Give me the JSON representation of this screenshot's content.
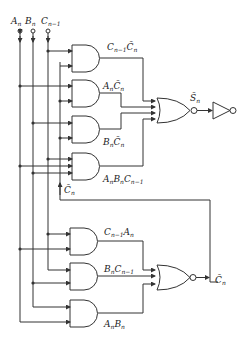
{
  "diagram": {
    "inputs": [
      {
        "id": "An",
        "label": "A",
        "sub": "n"
      },
      {
        "id": "Bn",
        "label": "B",
        "sub": "n"
      },
      {
        "id": "Cn1",
        "label": "C",
        "sub": "n−1"
      }
    ],
    "sum_section": {
      "and_gates": [
        {
          "id": "g1",
          "label": "C",
          "sub": "n−1",
          "label2": "C̄",
          "sub2": "n"
        },
        {
          "id": "g2",
          "label": "A",
          "sub": "n",
          "label2": "C̄",
          "sub2": "n"
        },
        {
          "id": "g3",
          "label": "B",
          "sub": "n",
          "label2": "C̄",
          "sub2": "n"
        },
        {
          "id": "g4",
          "label": "A",
          "sub": "n",
          "label2": "B",
          "sub2": "n",
          "label3": "C",
          "sub3": "n−1"
        }
      ],
      "nor_gate": {
        "output_label": "S̄",
        "output_sub": "n"
      },
      "inverter": {
        "type": "NOT"
      },
      "feedback_label": "C̄",
      "feedback_sub": "n"
    },
    "carry_section": {
      "and_gates": [
        {
          "id": "g5",
          "label": "C",
          "sub": "n−1",
          "label2": "A",
          "sub2": "n"
        },
        {
          "id": "g6",
          "label": "B",
          "sub": "n",
          "label2": "C",
          "sub2": "n−1"
        },
        {
          "id": "g7",
          "label": "A",
          "sub": "n",
          "label2": "B",
          "sub2": "n"
        }
      ],
      "nor_gate": {
        "output_label": "C̄",
        "output_sub": "n"
      }
    }
  }
}
